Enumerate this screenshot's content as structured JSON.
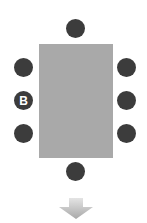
{
  "diagram": {
    "title": "",
    "table": {
      "shape": "rectangle",
      "color": "#a9a9a9"
    },
    "seat_color": "#3c3c3c",
    "seats": [
      {
        "id": "top",
        "label": ""
      },
      {
        "id": "left-1",
        "label": ""
      },
      {
        "id": "left-2",
        "label": "B"
      },
      {
        "id": "left-3",
        "label": ""
      },
      {
        "id": "right-1",
        "label": ""
      },
      {
        "id": "right-2",
        "label": ""
      },
      {
        "id": "right-3",
        "label": ""
      },
      {
        "id": "bottom",
        "label": ""
      }
    ],
    "arrow": {
      "direction": "down",
      "color": "#b5b5b5"
    }
  }
}
